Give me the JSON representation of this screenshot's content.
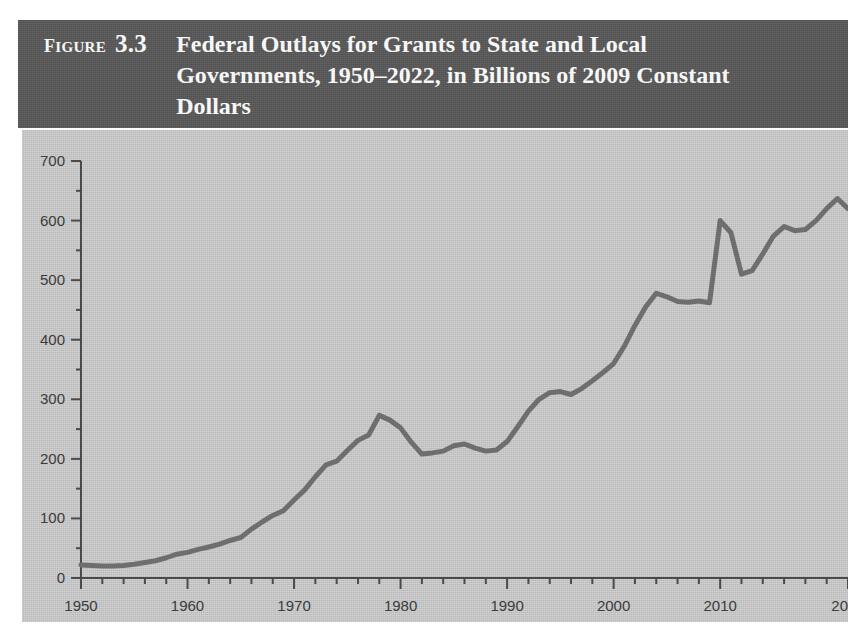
{
  "figure": {
    "label_word": "Figure",
    "number": "3.3",
    "title": "Federal Outlays for Grants to State and Local Governments, 1950–2022, in Billions of 2009 Constant Dollars"
  },
  "colors": {
    "header_background": "#575757",
    "header_text": "#ffffff",
    "plot_background": "#c4c4c4",
    "line": "#6e6e6e",
    "axis": "#4a4a4a",
    "tick_label": "#3b3b3b"
  },
  "chart_data": {
    "type": "line",
    "title": "Federal Outlays for Grants to State and Local Governments, 1950–2022, in Billions of 2009 Constant Dollars",
    "xlabel": "",
    "ylabel": "",
    "xlim": [
      1950,
      2022
    ],
    "ylim": [
      0,
      700
    ],
    "grid": false,
    "legend": "none",
    "y_ticks": [
      0,
      100,
      200,
      300,
      400,
      500,
      600,
      700
    ],
    "y_tick_labels": [
      "0",
      "100",
      "200",
      "300",
      "400",
      "500",
      "600",
      "700"
    ],
    "y_minor_tick_step": 50,
    "x_ticks": [
      1950,
      1960,
      1970,
      1980,
      1990,
      2000,
      2010,
      2022
    ],
    "x_tick_labels": [
      "1950",
      "1960",
      "1970",
      "1980",
      "1990",
      "2000",
      "2010",
      "2022"
    ],
    "x_minor_tick_step": 2,
    "series": [
      {
        "name": "Federal outlays for grants to state and local governments",
        "units": "Billions of 2009 constant dollars",
        "x": [
          1950,
          1951,
          1952,
          1953,
          1954,
          1955,
          1956,
          1957,
          1958,
          1959,
          1960,
          1961,
          1962,
          1963,
          1964,
          1965,
          1966,
          1967,
          1968,
          1969,
          1970,
          1971,
          1972,
          1973,
          1974,
          1975,
          1976,
          1977,
          1978,
          1979,
          1980,
          1981,
          1982,
          1983,
          1984,
          1985,
          1986,
          1987,
          1988,
          1989,
          1990,
          1991,
          1992,
          1993,
          1994,
          1995,
          1996,
          1997,
          1998,
          1999,
          2000,
          2001,
          2002,
          2003,
          2004,
          2005,
          2006,
          2007,
          2008,
          2009,
          2010,
          2011,
          2012,
          2013,
          2014,
          2015,
          2016,
          2017,
          2018,
          2019,
          2020,
          2021,
          2022
        ],
        "values": [
          22,
          21,
          20,
          20,
          21,
          23,
          26,
          29,
          34,
          40,
          43,
          48,
          52,
          57,
          63,
          68,
          82,
          94,
          105,
          113,
          131,
          148,
          170,
          190,
          196,
          214,
          231,
          240,
          273,
          265,
          252,
          228,
          208,
          210,
          213,
          222,
          225,
          218,
          213,
          215,
          229,
          254,
          280,
          300,
          311,
          313,
          308,
          318,
          331,
          345,
          360,
          389,
          424,
          455,
          478,
          472,
          464,
          463,
          465,
          462,
          600,
          580,
          510,
          516,
          544,
          574,
          590,
          583,
          585,
          600,
          620,
          637,
          620
        ]
      }
    ],
    "annotations": []
  }
}
